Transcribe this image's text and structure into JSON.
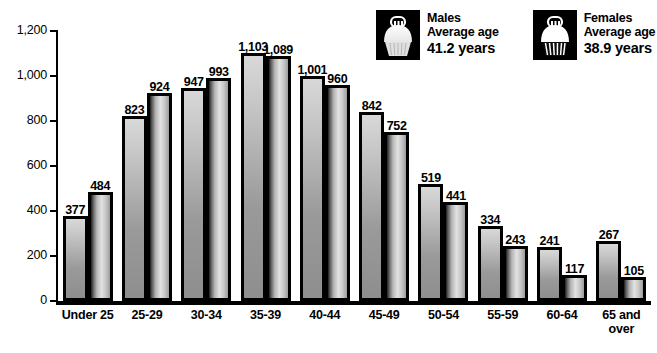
{
  "chart_data": {
    "type": "bar",
    "title": "",
    "subtitle": "",
    "xlabel": "",
    "ylabel": "",
    "ylim": [
      0,
      1200
    ],
    "yticks": [
      0,
      200,
      400,
      600,
      800,
      1000,
      1200
    ],
    "ytick_labels": [
      "0",
      "200",
      "400",
      "600",
      "800",
      "1,000",
      "1,200"
    ],
    "grid": false,
    "legend_position": "top-right",
    "categories": [
      "Under 25",
      "25-29",
      "30-34",
      "35-39",
      "40-44",
      "45-49",
      "50-54",
      "55-59",
      "60-64",
      "65 and\nover"
    ],
    "series": [
      {
        "name": "Males",
        "values": [
          377,
          823,
          947,
          1103,
          1001,
          842,
          519,
          334,
          241,
          267
        ],
        "value_labels": [
          "377",
          "823",
          "947",
          "1,103",
          "1,001",
          "842",
          "519",
          "334",
          "241",
          "267"
        ]
      },
      {
        "name": "Females",
        "values": [
          484,
          924,
          993,
          1089,
          960,
          752,
          441,
          243,
          117,
          105
        ],
        "value_labels": [
          "484",
          "924",
          "993",
          "1,089",
          "960",
          "752",
          "441",
          "243",
          "117",
          "105"
        ]
      }
    ]
  },
  "legend": {
    "entries": [
      {
        "icon": "cupcake-icon",
        "title": "Males",
        "subtitle": "Average age",
        "age": "41.2 years"
      },
      {
        "icon": "cupcake-icon",
        "title": "Females",
        "subtitle": "Average age",
        "age": "38.9 years"
      }
    ]
  },
  "colors": {
    "background": "#ffffff",
    "axis": "#000000",
    "text": "#000000",
    "male_bar_light": "#d8d8d8",
    "male_bar_dark": "#8e8e8e",
    "female_bar_dark": "#1c1c1c",
    "female_bar_light": "#e2e2e2",
    "legend_swatch_background": "#000000"
  }
}
